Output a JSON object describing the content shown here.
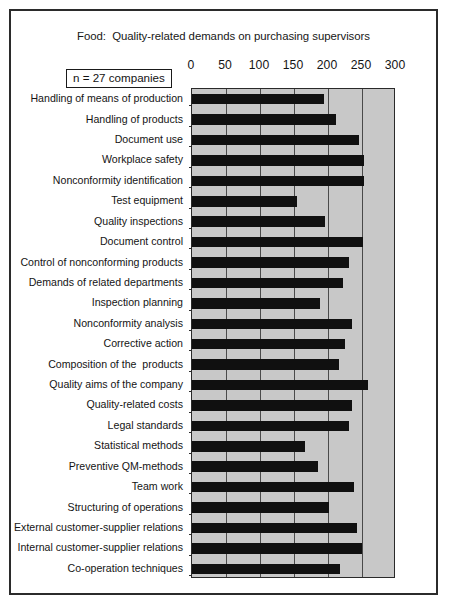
{
  "figure": {
    "title": "Food:  Quality-related demands on purchasing supervisors",
    "sample_note": "n = 27 companies",
    "frame_color": "#2b2b2b",
    "plot_background": "#c8c8c8",
    "bar_color": "#101010"
  },
  "chart_data": {
    "type": "bar",
    "orientation": "horizontal",
    "title": "Food:  Quality-related demands on purchasing supervisors",
    "xlabel": "",
    "ylabel": "",
    "xlim": [
      0,
      300
    ],
    "xticks": [
      0,
      50,
      100,
      150,
      200,
      250,
      300
    ],
    "tick_labels": [
      "0",
      "50",
      "100",
      "150",
      "200",
      "250",
      "300"
    ],
    "grid": true,
    "legend": false,
    "annotation": "n = 27 companies",
    "categories": [
      "Handling of means of production",
      "Handling of products",
      "Document use",
      "Workplace safety",
      "Nonconformity identification",
      "Test equipment",
      "Quality inspections",
      "Document control",
      "Control of nonconforming products",
      "Demands of related departments",
      "Inspection planning",
      "Nonconformity analysis",
      "Corrective action",
      "Composition of the  products",
      "Quality aims of the company",
      "Quality-related costs",
      "Legal standards",
      "Statistical methods",
      "Preventive QM-methods",
      "Team work",
      "Structuring of operations",
      "External customer-supplier relations",
      "Internal customer-supplier relations",
      "Co-operation techniques"
    ],
    "values": [
      194,
      212,
      246,
      253,
      253,
      154,
      196,
      251,
      231,
      222,
      188,
      235,
      225,
      216,
      259,
      236,
      231,
      166,
      185,
      238,
      201,
      243,
      250,
      218
    ]
  }
}
